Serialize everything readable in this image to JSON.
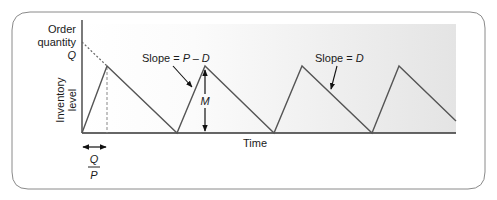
{
  "diagram": {
    "type": "inventory-sawtooth",
    "y_axis": {
      "label_line1": "Inventory",
      "label_line2": "level",
      "top_label_line1": "Order",
      "top_label_line2": "quantity",
      "top_value": "Q"
    },
    "x_axis": {
      "label": "Time"
    },
    "annotations": {
      "slope_production_prefix": "Slope = ",
      "slope_production_var": "P – D",
      "slope_demand_prefix": "Slope = ",
      "slope_demand_var": "D",
      "max_level": "M",
      "production_time_num": "Q",
      "production_time_den": "P"
    },
    "cycles": [
      {
        "start_x": 82,
        "peak_x": 107,
        "end_x": 177
      },
      {
        "start_x": 177,
        "peak_x": 205,
        "end_x": 274
      },
      {
        "start_x": 274,
        "peak_x": 302,
        "end_x": 372
      },
      {
        "start_x": 372,
        "peak_x": 399,
        "end_x": 456
      }
    ],
    "colors": {
      "line": "#555555",
      "axis": "#333333",
      "frame": "#777777",
      "gradient_start": "#ffffff",
      "gradient_end": "#e4e4e4"
    }
  }
}
